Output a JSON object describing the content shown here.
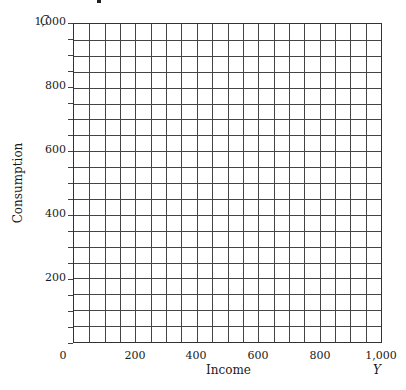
{
  "chart_data": {
    "type": "line",
    "title": "",
    "xlabel": "Income",
    "ylabel": "Consumption",
    "x_axis_symbol": "Y",
    "y_axis_symbol": "C",
    "xlim": [
      0,
      1000
    ],
    "ylim": [
      0,
      1000
    ],
    "x_ticks": [
      "0",
      "200",
      "400",
      "600",
      "800",
      "1,000"
    ],
    "y_ticks": [
      "200",
      "400",
      "600",
      "800",
      "1,000"
    ],
    "grid": true,
    "grid_divisions": {
      "x": 20,
      "y": 20,
      "step": 50
    },
    "series": []
  },
  "axes": {
    "y_symbol": "C",
    "x_symbol": "Y",
    "x_title": "Income",
    "y_title": "Consumption",
    "y_ticks": [
      {
        "label": "1,000",
        "value": 1000
      },
      {
        "label": "800",
        "value": 800
      },
      {
        "label": "600",
        "value": 600
      },
      {
        "label": "400",
        "value": 400
      },
      {
        "label": "200",
        "value": 200
      }
    ],
    "x_ticks": [
      {
        "label": "0",
        "value": 0
      },
      {
        "label": "200",
        "value": 200
      },
      {
        "label": "400",
        "value": 400
      },
      {
        "label": "600",
        "value": 600
      },
      {
        "label": "800",
        "value": 800
      },
      {
        "label": "1,000",
        "value": 1000
      }
    ]
  }
}
